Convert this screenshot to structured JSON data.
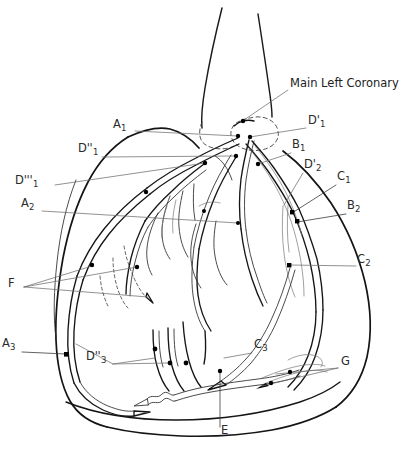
{
  "figure": {
    "type": "anatomical-line-diagram",
    "background_color": "#ffffff",
    "line_color": "#141414",
    "leader_color": "#6d6d6d",
    "width": 402,
    "height": 452
  },
  "labels": [
    {
      "id": "main-left-coronary",
      "text": "Main Left Coronary",
      "base": "Main Left Coronary",
      "sub": "",
      "x": 290,
      "y": 85,
      "anchor_x": 243,
      "anchor_y": 121
    },
    {
      "id": "a1",
      "text": "A1",
      "base": "A",
      "sub": "1",
      "x": 113,
      "y": 126,
      "anchor_x": 238,
      "anchor_y": 136
    },
    {
      "id": "d-prime-1",
      "text": "D'1",
      "base": "D'",
      "sub": "1",
      "x": 308,
      "y": 122,
      "anchor_x": 249,
      "anchor_y": 137
    },
    {
      "id": "d-dprime-1",
      "text": "D''1",
      "base": "D''",
      "sub": "1",
      "x": 80,
      "y": 150,
      "anchor_x": 236,
      "anchor_y": 156
    },
    {
      "id": "b1",
      "text": "B1",
      "base": "B",
      "sub": "1",
      "x": 293,
      "y": 146,
      "anchor_x": 257,
      "anchor_y": 163
    },
    {
      "id": "d-tprime-1",
      "text": "D'''1",
      "base": "D'''",
      "sub": "1",
      "x": 16,
      "y": 182,
      "anchor_x": 204,
      "anchor_y": 163
    },
    {
      "id": "d-prime-2",
      "text": "D'2",
      "base": "D'",
      "sub": "2",
      "x": 305,
      "y": 166,
      "anchor_x": 283,
      "anchor_y": 205
    },
    {
      "id": "c1",
      "text": "C1",
      "base": "C",
      "sub": "1",
      "x": 338,
      "y": 178,
      "anchor_x": 292,
      "anchor_y": 212
    },
    {
      "id": "a2",
      "text": "A2",
      "base": "A",
      "sub": "2",
      "x": 22,
      "y": 205,
      "anchor_x": 238,
      "anchor_y": 223
    },
    {
      "id": "b2",
      "text": "B2",
      "base": "B",
      "sub": "2",
      "x": 348,
      "y": 207,
      "anchor_x": 298,
      "anchor_y": 221
    },
    {
      "id": "c2",
      "text": "C2",
      "base": "C",
      "sub": "2",
      "x": 358,
      "y": 261,
      "anchor_x": 290,
      "anchor_y": 265
    },
    {
      "id": "f",
      "text": "F",
      "base": "F",
      "sub": "",
      "x": 9,
      "y": 284,
      "anchor_x": 137,
      "anchor_y": 285
    },
    {
      "id": "a3",
      "text": "A3",
      "base": "A",
      "sub": "3",
      "x": 2,
      "y": 345,
      "anchor_x": 62,
      "anchor_y": 354
    },
    {
      "id": "d-dprime-3",
      "text": "D''3",
      "base": "D''",
      "sub": "3",
      "x": 88,
      "y": 358,
      "anchor_x": 168,
      "anchor_y": 362
    },
    {
      "id": "c3",
      "text": "C3",
      "base": "C",
      "sub": "3",
      "x": 255,
      "y": 346,
      "anchor_x": 222,
      "anchor_y": 357
    },
    {
      "id": "g",
      "text": "G",
      "base": "G",
      "sub": "",
      "x": 341,
      "y": 363,
      "anchor_x": 272,
      "anchor_y": 377
    },
    {
      "id": "e",
      "text": "E",
      "base": "E",
      "sub": "",
      "x": 222,
      "y": 432,
      "anchor_x": 220,
      "anchor_y": 372
    }
  ],
  "legend_keys": {
    "A": "anterior descending segments",
    "B": "circumflex segments",
    "C": "marginal / posterolateral segments",
    "D": "diagonal branches",
    "E": "posterior descending",
    "F": "septal perforators",
    "G": "distal circumflex branches"
  }
}
